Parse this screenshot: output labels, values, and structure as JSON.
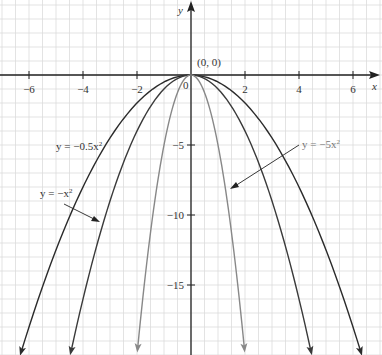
{
  "chart_data": {
    "type": "line",
    "title": "",
    "xlabel": "x",
    "ylabel": "y",
    "xlim": [
      -7,
      7
    ],
    "ylim": [
      -20,
      5.3
    ],
    "grid": true,
    "x_ticks": [
      -6,
      -4,
      -2,
      0,
      2,
      4,
      6
    ],
    "x_tick_labels": [
      "−6",
      "−4",
      "−2",
      "0",
      "2",
      "4",
      "6"
    ],
    "y_ticks": [
      -5,
      -10,
      -15
    ],
    "y_tick_labels": [
      "−5",
      "−10",
      "−15"
    ],
    "origin_label": "(0, 0)",
    "series": [
      {
        "name": "y = −0.5x²",
        "coef": -0.5,
        "color": "#2b2b2b",
        "x_range": [
          -6.3,
          6.3
        ],
        "points": [
          [
            -6,
            -18
          ],
          [
            -4,
            -8
          ],
          [
            -2,
            -2
          ],
          [
            0,
            0
          ],
          [
            2,
            -2
          ],
          [
            4,
            -8
          ],
          [
            6,
            -18
          ]
        ]
      },
      {
        "name": "y = −x²",
        "coef": -1,
        "color": "#3a3a3a",
        "x_range": [
          -4.45,
          4.45
        ],
        "points": [
          [
            -4,
            -16
          ],
          [
            -3,
            -9
          ],
          [
            -2,
            -4
          ],
          [
            -1,
            -1
          ],
          [
            0,
            0
          ],
          [
            1,
            -1
          ],
          [
            2,
            -4
          ],
          [
            3,
            -9
          ],
          [
            4,
            -16
          ]
        ]
      },
      {
        "name": "y = −5x²",
        "coef": -5,
        "color": "#888888",
        "x_range": [
          -1.98,
          1.98
        ],
        "points": [
          [
            -1.5,
            -11.25
          ],
          [
            -1,
            -5
          ],
          [
            -0.5,
            -1.25
          ],
          [
            0,
            0
          ],
          [
            0.5,
            -1.25
          ],
          [
            1,
            -5
          ],
          [
            1.5,
            -11.25
          ]
        ]
      }
    ],
    "annotations": [
      {
        "text": "y = −0.5x²",
        "position": "left, near y=-5"
      },
      {
        "text": "y = −x²",
        "position": "left, arrow to -x² curve"
      },
      {
        "text": "y = −5x²",
        "position": "right, arrow to -5x² curve"
      }
    ]
  },
  "labels": {
    "x_axis": "x",
    "y_axis": "y",
    "origin": "(0, 0)",
    "zero": "0",
    "half": "y = −0.5x",
    "one": "y = −x",
    "five": "y = −5x",
    "sup": "2"
  }
}
